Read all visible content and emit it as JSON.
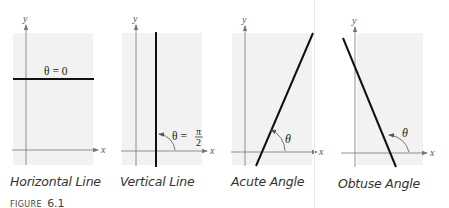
{
  "figure": {
    "label_prefix": "FIGURE",
    "label_number": "6.1",
    "colors": {
      "background": "#ffffff",
      "panel_fill": "#f2f2f2",
      "axis": "#777777",
      "line": "#111111",
      "divider": "#e6e6e6"
    },
    "panels": [
      {
        "caption": "Horizontal Line",
        "angle_label": "θ = 0",
        "x_axis_label": "x",
        "y_axis_label": "y"
      },
      {
        "caption": "Vertical Line",
        "angle_label": "θ =",
        "angle_fraction_num": "π",
        "angle_fraction_den": "2",
        "x_axis_label": "x",
        "y_axis_label": "y"
      },
      {
        "caption": "Acute Angle",
        "angle_label": "θ",
        "x_axis_label": "x",
        "y_axis_label": "y"
      },
      {
        "caption": "Obtuse Angle",
        "angle_label": "θ",
        "x_axis_label": "x",
        "y_axis_label": "y"
      }
    ]
  }
}
